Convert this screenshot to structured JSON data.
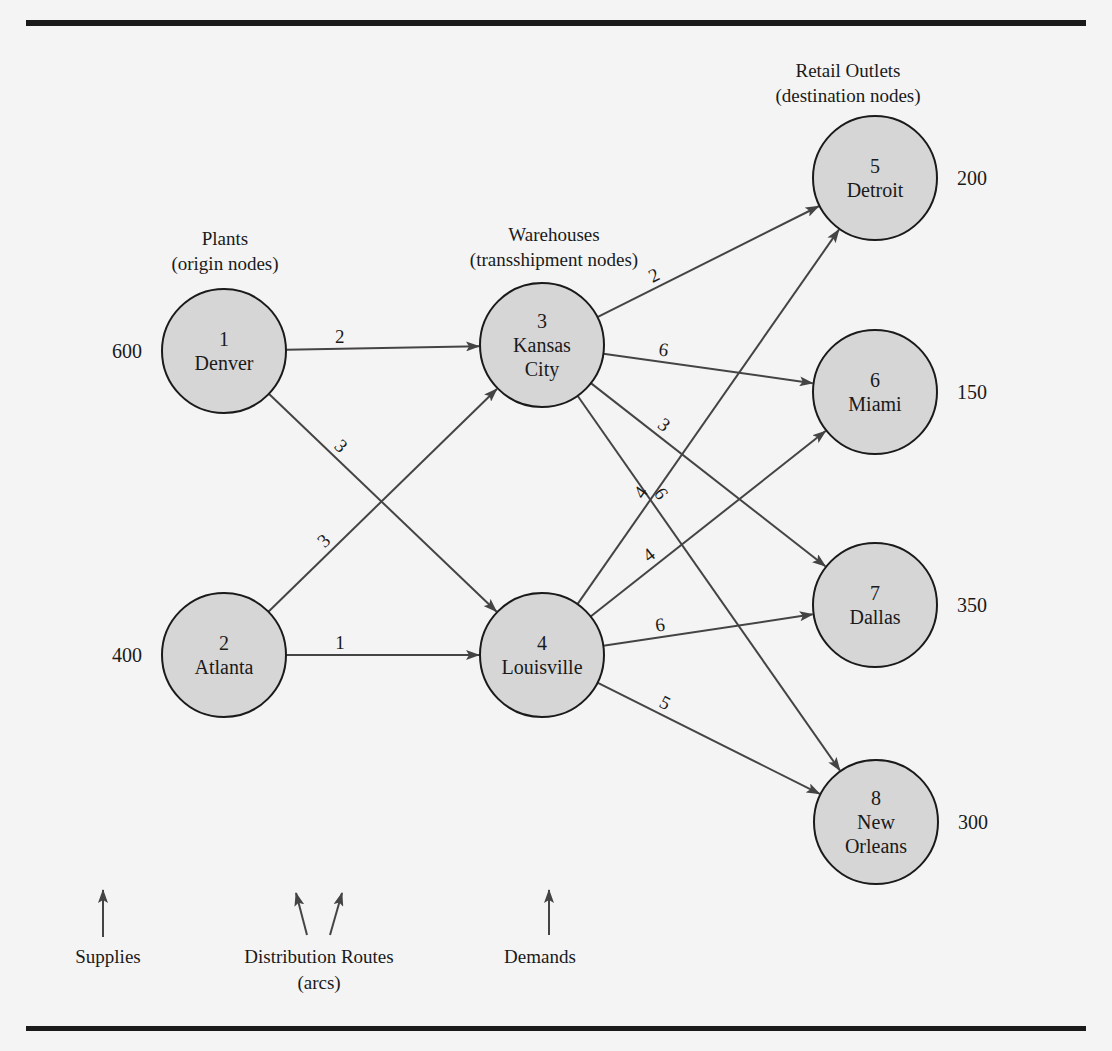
{
  "header_fragment": "TRANSSHIPMENT PROBLEM",
  "columns": {
    "plants": {
      "title": "Plants",
      "subtitle": "(origin nodes)"
    },
    "warehouses": {
      "title": "Warehouses",
      "subtitle": "(transshipment nodes)"
    },
    "retail": {
      "title": "Retail Outlets",
      "subtitle": "(destination nodes)"
    }
  },
  "nodes": [
    {
      "id": "1",
      "name": [
        "Denver"
      ],
      "type": "origin",
      "cx": 224,
      "cy": 351,
      "supply": "600"
    },
    {
      "id": "2",
      "name": [
        "Atlanta"
      ],
      "type": "origin",
      "cx": 224,
      "cy": 655,
      "supply": "400"
    },
    {
      "id": "3",
      "name": [
        "Kansas",
        "City"
      ],
      "type": "transshipment",
      "cx": 542,
      "cy": 345
    },
    {
      "id": "4",
      "name": [
        "Louisville"
      ],
      "type": "transshipment",
      "cx": 542,
      "cy": 655
    },
    {
      "id": "5",
      "name": [
        "Detroit"
      ],
      "type": "destination",
      "cx": 875,
      "cy": 178,
      "demand": "200"
    },
    {
      "id": "6",
      "name": [
        "Miami"
      ],
      "type": "destination",
      "cx": 875,
      "cy": 392,
      "demand": "150"
    },
    {
      "id": "7",
      "name": [
        "Dallas"
      ],
      "type": "destination",
      "cx": 875,
      "cy": 605,
      "demand": "350"
    },
    {
      "id": "8",
      "name": [
        "New",
        "Orleans"
      ],
      "type": "destination",
      "cx": 876,
      "cy": 822,
      "demand": "300"
    }
  ],
  "arcs": [
    {
      "from": "1",
      "to": "3",
      "cost": "2"
    },
    {
      "from": "1",
      "to": "4",
      "cost": "3"
    },
    {
      "from": "2",
      "to": "3",
      "cost": "3"
    },
    {
      "from": "2",
      "to": "4",
      "cost": "1"
    },
    {
      "from": "3",
      "to": "5",
      "cost": "2"
    },
    {
      "from": "3",
      "to": "6",
      "cost": "6"
    },
    {
      "from": "3",
      "to": "7",
      "cost": "3"
    },
    {
      "from": "3",
      "to": "8",
      "cost": "6"
    },
    {
      "from": "4",
      "to": "5",
      "cost": "4"
    },
    {
      "from": "4",
      "to": "6",
      "cost": "4"
    },
    {
      "from": "4",
      "to": "7",
      "cost": "6"
    },
    {
      "from": "4",
      "to": "8",
      "cost": "5"
    }
  ],
  "footer": {
    "supplies": "Supplies",
    "routes": "Distribution Routes",
    "routes_sub": "(arcs)",
    "demands": "Demands"
  }
}
